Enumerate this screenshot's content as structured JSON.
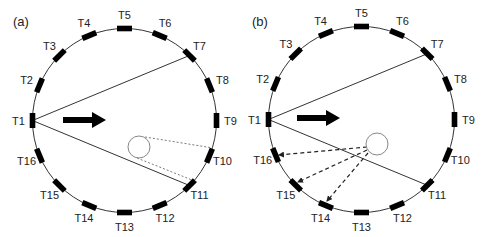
{
  "panels": [
    {
      "id": "a",
      "label": "(a)",
      "label_pos": [
        13,
        26
      ],
      "center": [
        124.5,
        120.5
      ],
      "radius": 92,
      "label_radius": 106,
      "transducers": [
        {
          "name": "T1",
          "angle": 180
        },
        {
          "name": "T2",
          "angle": 157.5
        },
        {
          "name": "T3",
          "angle": 135
        },
        {
          "name": "T4",
          "angle": 112.5
        },
        {
          "name": "T5",
          "angle": 90
        },
        {
          "name": "T6",
          "angle": 67.5
        },
        {
          "name": "T7",
          "angle": 45
        },
        {
          "name": "T8",
          "angle": 22.5
        },
        {
          "name": "T9",
          "angle": 0
        },
        {
          "name": "T10",
          "angle": -22.5
        },
        {
          "name": "T11",
          "angle": -45
        },
        {
          "name": "T12",
          "angle": -67.5
        },
        {
          "name": "T13",
          "angle": -90
        },
        {
          "name": "T14",
          "angle": -112.5
        },
        {
          "name": "T15",
          "angle": -135
        },
        {
          "name": "T16",
          "angle": -157.5
        }
      ],
      "beam_lines": [
        {
          "from": "T1",
          "to": "T7"
        },
        {
          "from": "T1",
          "to": "T11"
        }
      ],
      "arrow": {
        "x1": 63,
        "x2": 106,
        "y": 120
      },
      "scatterer": {
        "cx": 139,
        "cy": 147,
        "r": 11
      },
      "shadow_lines": [
        {
          "x1": 145,
          "y1": 137,
          "x2": 213,
          "y2": 148
        },
        {
          "x1": 137,
          "y1": 158,
          "x2": 197,
          "y2": 182
        }
      ],
      "scatter_arrows": []
    },
    {
      "id": "b",
      "label": "(b)",
      "label_pos": [
        252,
        26
      ],
      "center": [
        361.5,
        119.5
      ],
      "radius": 93,
      "label_radius": 107,
      "transducers": [
        {
          "name": "T1",
          "angle": 180
        },
        {
          "name": "T2",
          "angle": 157.5
        },
        {
          "name": "T3",
          "angle": 135
        },
        {
          "name": "T4",
          "angle": 112.5
        },
        {
          "name": "T5",
          "angle": 90
        },
        {
          "name": "T6",
          "angle": 67.5
        },
        {
          "name": "T7",
          "angle": 45
        },
        {
          "name": "T8",
          "angle": 22.5
        },
        {
          "name": "T9",
          "angle": 0
        },
        {
          "name": "T10",
          "angle": -22.5
        },
        {
          "name": "T11",
          "angle": -45
        },
        {
          "name": "T12",
          "angle": -67.5
        },
        {
          "name": "T13",
          "angle": -90
        },
        {
          "name": "T14",
          "angle": -112.5
        },
        {
          "name": "T15",
          "angle": -135
        },
        {
          "name": "T16",
          "angle": -157.5
        }
      ],
      "beam_lines": [
        {
          "from": "T1",
          "to": "T7"
        },
        {
          "from": "T1",
          "to": "T11"
        }
      ],
      "arrow": {
        "x1": 297,
        "x2": 340,
        "y": 118
      },
      "scatterer": {
        "cx": 377,
        "cy": 144,
        "r": 11
      },
      "shadow_lines": [],
      "scatter_arrows": [
        {
          "x1": 367,
          "y1": 147,
          "x2": 279,
          "y2": 155,
          "target": "T16"
        },
        {
          "x1": 367,
          "y1": 150,
          "x2": 298,
          "y2": 182,
          "target": "T15"
        },
        {
          "x1": 368,
          "y1": 153,
          "x2": 327,
          "y2": 201,
          "target": "T14"
        }
      ]
    }
  ],
  "colors": {
    "stroke": "#333333",
    "marker": "#000000",
    "text": "#222222",
    "scatterer": "#888888",
    "background": "#ffffff"
  }
}
